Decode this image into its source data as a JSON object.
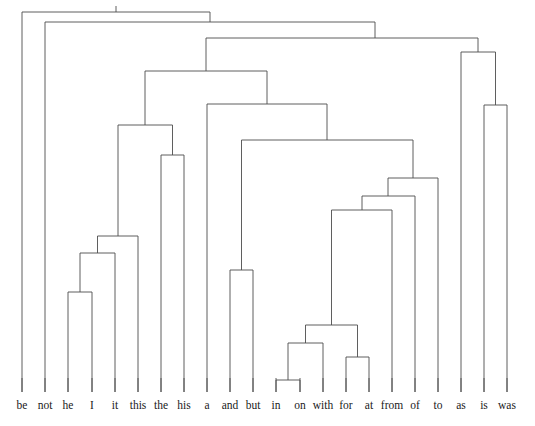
{
  "figure": {
    "kind": "dendrogram",
    "title": "",
    "background_color": "#ffffff",
    "line_color": "#4d4d4d",
    "label_color": "#1a1a1a",
    "width": 535,
    "height": 426
  },
  "chart_data": {
    "type": "dendrogram",
    "title": "",
    "xlabel": "",
    "ylabel": "",
    "orientation": "top-down",
    "grid": false,
    "legend": null,
    "leaf_count": 22,
    "leaf_labels": [
      "be",
      "not",
      "he",
      "I",
      "it",
      "this",
      "the",
      "his",
      "a",
      "and",
      "but",
      "in",
      "on",
      "with",
      "for",
      "at",
      "from",
      "of",
      "to",
      "as",
      "is",
      "was"
    ],
    "leaf_x_positions": [
      22,
      45,
      68,
      92,
      115,
      138,
      161,
      184,
      207,
      230,
      253,
      276,
      300,
      323,
      346,
      369,
      392,
      415,
      438,
      461,
      484,
      507
    ],
    "leaf_baseline_y": 392,
    "merges": [
      {
        "id": "m1",
        "label": "he + I",
        "left": "he",
        "right": "I",
        "x": 80,
        "y": 292
      },
      {
        "id": "m2",
        "label": "(he,I) + it",
        "left": "m1",
        "right": "it",
        "x": 97.5,
        "y": 253
      },
      {
        "id": "m3",
        "label": "(he,I,it) + this",
        "left": "m2",
        "right": "this",
        "x": 118,
        "y": 236
      },
      {
        "id": "m4",
        "label": "the + his",
        "left": "the",
        "right": "his",
        "x": 172.5,
        "y": 155
      },
      {
        "id": "m5",
        "label": "(this-cluster) + (the,his)",
        "left": "m3",
        "right": "m4",
        "x": 145,
        "y": 125
      },
      {
        "id": "m6",
        "label": "and + but",
        "left": "and",
        "right": "but",
        "x": 241.5,
        "y": 270
      },
      {
        "id": "m7",
        "label": "in + on",
        "left": "in",
        "right": "on",
        "x": 288,
        "y": 380
      },
      {
        "id": "m8",
        "label": "(in,on) + with",
        "left": "m7",
        "right": "with",
        "x": 305.5,
        "y": 343
      },
      {
        "id": "m9",
        "label": "for + at",
        "left": "for",
        "right": "at",
        "x": 357.5,
        "y": 357
      },
      {
        "id": "m10",
        "label": "(in,on,with) + (for,at)",
        "left": "m8",
        "right": "m9",
        "x": 331.5,
        "y": 325
      },
      {
        "id": "m11",
        "label": "(prep-core) + from",
        "left": "m10",
        "right": "from",
        "x": 362,
        "y": 210
      },
      {
        "id": "m12",
        "label": "(prep) + of",
        "left": "m11",
        "right": "of",
        "x": 388,
        "y": 196
      },
      {
        "id": "m13",
        "label": "(prep) + to",
        "left": "m12",
        "right": "to",
        "x": 413,
        "y": 178
      },
      {
        "id": "m14",
        "label": "(and,but) + prep-cluster",
        "left": "m6",
        "right": "m13",
        "x": 327,
        "y": 140
      },
      {
        "id": "m15",
        "label": "a + (prep-and-but)",
        "left": "a",
        "right": "m14",
        "x": 267,
        "y": 104
      },
      {
        "id": "m16",
        "label": "(this/the/his) + (a,...)",
        "left": "m5",
        "right": "m15",
        "x": 206,
        "y": 71
      },
      {
        "id": "m17",
        "label": "is + was",
        "left": "is",
        "right": "was",
        "x": 495.5,
        "y": 105
      },
      {
        "id": "m18",
        "label": "(as) + (is,was)",
        "left": "as",
        "right": "m17",
        "x": 478,
        "y": 52
      },
      {
        "id": "m19",
        "label": "main-branch + right",
        "left": "m16",
        "right": "m18",
        "x": 375,
        "y": 38
      },
      {
        "id": "m20",
        "label": "not + rest",
        "left": "not",
        "right": "m19",
        "x": 210,
        "y": 22
      },
      {
        "id": "m21",
        "label": "be + everything",
        "left": "be",
        "right": "m20",
        "x": 116,
        "y": 12
      }
    ]
  }
}
